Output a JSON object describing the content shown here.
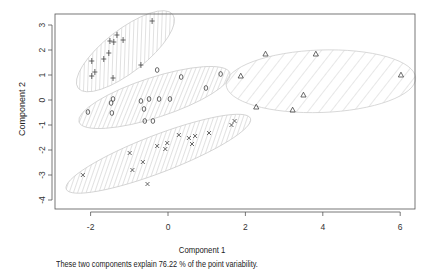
{
  "chart_data": {
    "type": "scatter",
    "title": "",
    "xlabel": "Component 1",
    "ylabel": "Component 2",
    "xlim": [
      -2.45,
      6.4
    ],
    "ylim": [
      -4.35,
      3.45
    ],
    "x_ticks": [
      -2,
      0,
      2,
      4,
      6
    ],
    "y_ticks": [
      -4,
      -3,
      -2,
      -1,
      0,
      1,
      2,
      3
    ],
    "grid": false,
    "legend": null,
    "caption": "These two components explain 76.22 % of the point variability.",
    "series": [
      {
        "name": "cluster 1",
        "marker": "+",
        "points": [
          [
            -0.41,
            3.16
          ],
          [
            -1.32,
            2.6
          ],
          [
            -1.5,
            2.36
          ],
          [
            -1.4,
            2.32
          ],
          [
            -1.16,
            2.4
          ],
          [
            -1.53,
            1.88
          ],
          [
            -1.66,
            1.64
          ],
          [
            -1.97,
            1.56
          ],
          [
            -1.89,
            1.12
          ],
          [
            -1.97,
            0.96
          ],
          [
            -1.42,
            0.88
          ],
          [
            -0.7,
            1.4
          ]
        ],
        "ellipse": {
          "cx": -1.1,
          "cy": 1.95,
          "rx": 1.55,
          "ry": 0.85,
          "angle_deg": -38
        }
      },
      {
        "name": "cluster 2",
        "marker": "o",
        "points": [
          [
            -2.07,
            -0.48
          ],
          [
            -1.47,
            -0.12
          ],
          [
            -1.42,
            0.04
          ],
          [
            -1.45,
            -0.52
          ],
          [
            -0.7,
            -0.04
          ],
          [
            -0.49,
            0.04
          ],
          [
            -0.23,
            0.04
          ],
          [
            0.05,
            0.04
          ],
          [
            -0.62,
            -0.36
          ],
          [
            -0.6,
            -0.84
          ],
          [
            -0.39,
            -0.84
          ],
          [
            -0.28,
            1.2
          ],
          [
            0.34,
            0.92
          ],
          [
            1.36,
            1.04
          ],
          [
            0.98,
            0.48
          ]
        ],
        "ellipse": {
          "cx": -0.35,
          "cy": 0.1,
          "rx": 2.05,
          "ry": 0.8,
          "angle_deg": -18
        }
      },
      {
        "name": "cluster 3",
        "marker": "triangle",
        "points": [
          [
            1.88,
            0.96
          ],
          [
            2.52,
            1.84
          ],
          [
            3.82,
            1.84
          ],
          [
            6.02,
            1.0
          ],
          [
            2.28,
            -0.28
          ],
          [
            3.22,
            -0.4
          ],
          [
            3.5,
            0.2
          ]
        ],
        "ellipse": {
          "cx": 3.95,
          "cy": 0.75,
          "rx": 2.45,
          "ry": 1.25,
          "angle_deg": -2
        }
      },
      {
        "name": "cluster 4",
        "marker": "x",
        "points": [
          [
            -2.2,
            -3.0
          ],
          [
            -0.99,
            -2.12
          ],
          [
            -0.65,
            -2.48
          ],
          [
            -0.92,
            -2.8
          ],
          [
            -0.53,
            -3.36
          ],
          [
            -0.28,
            -1.84
          ],
          [
            -0.02,
            -1.72
          ],
          [
            -0.07,
            -1.96
          ],
          [
            0.28,
            -1.4
          ],
          [
            0.54,
            -1.52
          ],
          [
            0.7,
            -1.44
          ],
          [
            0.62,
            -1.76
          ],
          [
            1.06,
            -1.32
          ],
          [
            1.72,
            -0.84
          ],
          [
            1.64,
            -1.0
          ]
        ],
        "ellipse": {
          "cx": -0.25,
          "cy": -2.15,
          "rx": 2.55,
          "ry": 0.75,
          "angle_deg": -21
        }
      }
    ]
  },
  "labels": {
    "xlabel": "Component 1",
    "ylabel": "Component 2",
    "caption": "These two components explain 76.22 % of the point variability."
  }
}
